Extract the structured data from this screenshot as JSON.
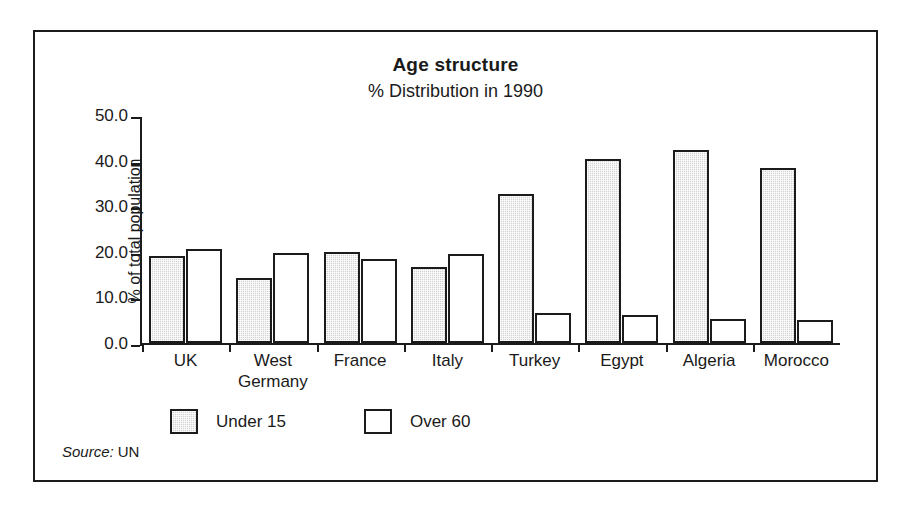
{
  "chart_data": {
    "type": "bar",
    "title": "Age structure",
    "subtitle": "% Distribution in 1990",
    "xlabel": "",
    "ylabel": "% of total population",
    "ylim": [
      0.0,
      50.0
    ],
    "yticks": [
      "50.0",
      "40.0",
      "30.0",
      "20.0",
      "10.0",
      "0.0"
    ],
    "ytick_values": [
      50.0,
      40.0,
      30.0,
      20.0,
      10.0,
      0.0
    ],
    "grid": false,
    "legend_position": "below-axes-left",
    "categories": [
      "UK",
      "West Germany",
      "France",
      "Italy",
      "Turkey",
      "Egypt",
      "Algeria",
      "Morocco"
    ],
    "category_lines": [
      [
        "UK"
      ],
      [
        "West",
        "Germany"
      ],
      [
        "France"
      ],
      [
        "Italy"
      ],
      [
        "Turkey"
      ],
      [
        "Egypt"
      ],
      [
        "Algeria"
      ],
      [
        "Morocco"
      ]
    ],
    "series": [
      {
        "name": "Under 15",
        "color": "#d2d2d2",
        "values": [
          19.0,
          14.2,
          20.0,
          16.7,
          32.6,
          40.4,
          42.3,
          38.3
        ]
      },
      {
        "name": "Over 60",
        "color": "#ffffff",
        "values": [
          20.7,
          19.7,
          18.5,
          19.5,
          6.5,
          6.2,
          5.2,
          5.0
        ]
      }
    ],
    "source_label": "Source:",
    "source_value": "UN"
  }
}
